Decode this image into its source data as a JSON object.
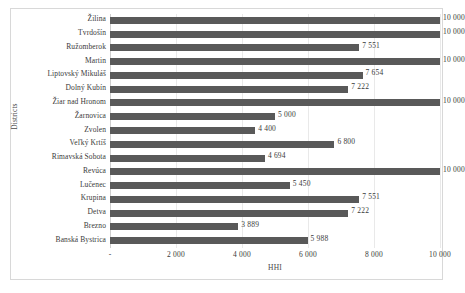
{
  "chart_data": {
    "type": "bar",
    "orientation": "horizontal",
    "title": "",
    "xlabel": "HHI",
    "ylabel": "Districts",
    "xlim": [
      0,
      10000
    ],
    "grid": true,
    "legend": "none",
    "xticks": [
      "-",
      "2 000",
      "4 000",
      "6 000",
      "8 000",
      "10 000"
    ],
    "xtick_values": [
      0,
      2000,
      4000,
      6000,
      8000,
      10000
    ],
    "bar_color": "#595959",
    "categories": [
      "Žilina",
      "Tvrdošín",
      "Ružomberok",
      "Martin",
      "Liptovský Mikuláš",
      "Dolný Kubín",
      "Žiar nad Hronom",
      "Žarnovica",
      "Zvolen",
      "Veľký Krtíš",
      "Rimavská Sobota",
      "Revúca",
      "Lučenec",
      "Krupina",
      "Detva",
      "Brezno",
      "Banská Bystrica"
    ],
    "values": [
      10000,
      10000,
      7551,
      10000,
      7654,
      7222,
      10000,
      5000,
      4400,
      6800,
      4694,
      10000,
      5450,
      7551,
      7222,
      3889,
      5988
    ],
    "value_labels": [
      "10 000",
      "10 000",
      "7 551",
      "10 000",
      "7 654",
      "7 222",
      "10 000",
      "5 000",
      "4 400",
      "6 800",
      "4 694",
      "10 000",
      "5 450",
      "7 551",
      "7 222",
      "3 889",
      "5 988"
    ]
  }
}
